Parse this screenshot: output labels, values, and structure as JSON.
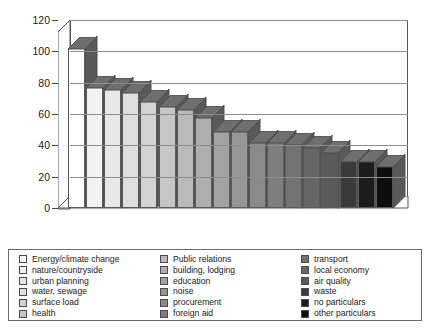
{
  "chart_data": {
    "type": "bar",
    "title": "",
    "xlabel": "",
    "ylabel": "",
    "ylim": [
      0,
      120
    ],
    "yticks": [
      0,
      20,
      40,
      60,
      80,
      100,
      120
    ],
    "grid": true,
    "legend_position": "bottom",
    "style": "3d-column",
    "categories": [
      "Energy/climate change",
      "nature/countryside",
      "urban planning",
      "water, sewage",
      "surface load",
      "health",
      "Public relations",
      "building, lodging",
      "education",
      "noise",
      "procurement",
      "foreign aid",
      "transport",
      "local economy",
      "air quality",
      "waste",
      "no particulars",
      "other particulars"
    ],
    "values": [
      102,
      77,
      76,
      74,
      68,
      65,
      63,
      58,
      49,
      49,
      42,
      42,
      41,
      39,
      36,
      30,
      30,
      27
    ],
    "colors": [
      "#ffffff",
      "#f2f2f2",
      "#e8e8e8",
      "#dedede",
      "#d2d2d2",
      "#c6c6c6",
      "#bababa",
      "#aeaeae",
      "#a2a2a2",
      "#969696",
      "#8a8a8a",
      "#7e7e7e",
      "#727272",
      "#666666",
      "#5a5a5a",
      "#3a3a3a",
      "#1c1c1c",
      "#0d0d0d"
    ]
  },
  "legend": {
    "columns": [
      {
        "items": [
          {
            "label": "Energy/climate change",
            "color": "#ffffff"
          },
          {
            "label": "nature/countryside",
            "color": "#f2f2f2"
          },
          {
            "label": "urban planning",
            "color": "#e8e8e8"
          },
          {
            "label": "water, sewage",
            "color": "#dedede"
          },
          {
            "label": "surface load",
            "color": "#d2d2d2"
          },
          {
            "label": "health",
            "color": "#c6c6c6"
          }
        ]
      },
      {
        "items": [
          {
            "label": "Public relations",
            "color": "#bababa"
          },
          {
            "label": "building, lodging",
            "color": "#aeaeae"
          },
          {
            "label": "education",
            "color": "#a2a2a2"
          },
          {
            "label": "noise",
            "color": "#969696"
          },
          {
            "label": "procurement",
            "color": "#8a8a8a"
          },
          {
            "label": "foreign aid",
            "color": "#7e7e7e"
          }
        ]
      },
      {
        "items": [
          {
            "label": "transport",
            "color": "#727272"
          },
          {
            "label": "local economy",
            "color": "#666666"
          },
          {
            "label": "air quality",
            "color": "#5a5a5a"
          },
          {
            "label": "waste",
            "color": "#3a3a3a"
          },
          {
            "label": "no particulars",
            "color": "#1c1c1c"
          },
          {
            "label": "other particulars",
            "color": "#0d0d0d"
          }
        ]
      }
    ]
  }
}
